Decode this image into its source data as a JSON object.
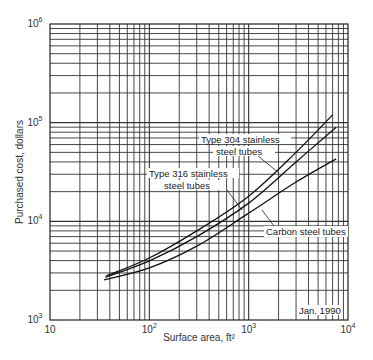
{
  "chart_data": {
    "type": "line",
    "title": "",
    "xlabel": "Surface area, ft²",
    "ylabel": "Purchased cost, dollars",
    "xscale": "log",
    "yscale": "log",
    "xlim": [
      10,
      10000
    ],
    "ylim": [
      1000,
      1000000
    ],
    "grid": true,
    "x_ticks": [
      {
        "base": "10",
        "exp": ""
      },
      {
        "base": "10",
        "exp": "2"
      },
      {
        "base": "10",
        "exp": "3"
      },
      {
        "base": "10",
        "exp": "4"
      }
    ],
    "y_ticks": [
      {
        "base": "10",
        "exp": "3"
      },
      {
        "base": "10",
        "exp": "4"
      },
      {
        "base": "10",
        "exp": "5"
      },
      {
        "base": "10",
        "exp": "6"
      }
    ],
    "series": [
      {
        "name": "Type 316 stainless steel tubes",
        "x": [
          37,
          100,
          300,
          1000,
          3000,
          7000
        ],
        "y": [
          2800,
          4250,
          8000,
          18000,
          50000,
          120000
        ]
      },
      {
        "name": "Type 304 stainless steel tubes",
        "x": [
          36,
          100,
          300,
          1000,
          3000,
          7600
        ],
        "y": [
          2700,
          3970,
          7000,
          15300,
          40000,
          90000
        ]
      },
      {
        "name": "Carbon steel tubes",
        "x": [
          35,
          100,
          300,
          1000,
          3000,
          7600
        ],
        "y": [
          2550,
          3370,
          5600,
          12100,
          25000,
          43000
        ]
      }
    ],
    "annotations": [
      {
        "text_line1": "Type 304 stainless",
        "text_line2": "steel tubes"
      },
      {
        "text_line1": "Type 316 stainless",
        "text_line2": "steel tubes"
      },
      {
        "text_line1": "Carbon steel tubes"
      },
      {
        "text_line1": "Jan. 1990"
      }
    ]
  }
}
